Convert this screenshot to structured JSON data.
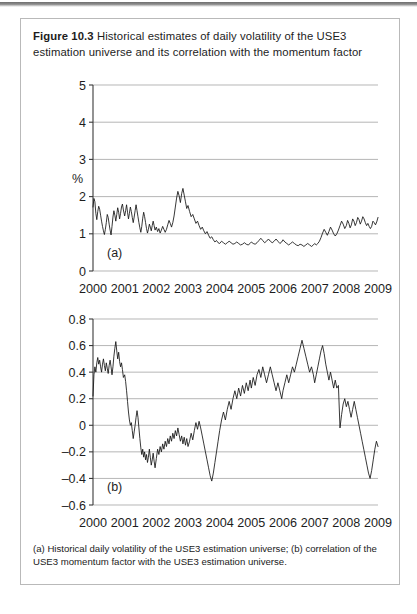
{
  "figure": {
    "label": "Figure 10.3",
    "title_text": "Historical estimates of daily volatility of the USE3 estimation universe and its correlation with the momentum factor",
    "caption": "(a) Historical daily volatility of the USE3 estimation universe; (b) correlation of the USE3 momentum factor with the USE3 estimation universe.",
    "border_color": "#b9b9b9"
  },
  "chart_data": [
    {
      "id": "a",
      "type": "line",
      "panel_label": "(a)",
      "title": "Historical daily volatility of the USE3 estimation universe",
      "xlabel": "",
      "ylabel": "%",
      "xlim": [
        2000,
        2009
      ],
      "ylim": [
        0,
        5
      ],
      "yticks": [
        0,
        1,
        2,
        3,
        4,
        5
      ],
      "ytick_labels": [
        "0",
        "1",
        "2",
        "3",
        "4",
        "5"
      ],
      "xticks": [
        2000,
        2001,
        2002,
        2003,
        2004,
        2005,
        2006,
        2007,
        2008,
        2009
      ],
      "xtick_labels": [
        "2000",
        "2001",
        "2002",
        "2003",
        "2004",
        "2005",
        "2006",
        "2007",
        "2008",
        "2009"
      ],
      "grid": "horizontal",
      "legend": "none",
      "line_color": "#141414",
      "series": [
        {
          "name": "USE3 daily volatility",
          "x": [
            2000.0,
            2000.03,
            2000.06,
            2000.09,
            2000.12,
            2000.15,
            2000.18,
            2000.21,
            2000.24,
            2000.27,
            2000.3,
            2000.33,
            2000.36,
            2000.39,
            2000.42,
            2000.45,
            2000.48,
            2000.51,
            2000.54,
            2000.57,
            2000.6,
            2000.63,
            2000.66,
            2000.69,
            2000.72,
            2000.75,
            2000.78,
            2000.81,
            2000.84,
            2000.87,
            2000.9,
            2000.93,
            2000.96,
            2001.0,
            2001.03,
            2001.06,
            2001.09,
            2001.12,
            2001.15,
            2001.18,
            2001.21,
            2001.24,
            2001.27,
            2001.3,
            2001.33,
            2001.36,
            2001.39,
            2001.42,
            2001.45,
            2001.48,
            2001.51,
            2001.54,
            2001.57,
            2001.6,
            2001.63,
            2001.66,
            2001.69,
            2001.72,
            2001.75,
            2001.78,
            2001.81,
            2001.84,
            2001.87,
            2001.9,
            2001.93,
            2001.96,
            2002.0,
            2002.04,
            2002.08,
            2002.12,
            2002.16,
            2002.2,
            2002.24,
            2002.28,
            2002.32,
            2002.36,
            2002.4,
            2002.44,
            2002.48,
            2002.52,
            2002.56,
            2002.6,
            2002.64,
            2002.68,
            2002.72,
            2002.76,
            2002.8,
            2002.84,
            2002.88,
            2002.92,
            2002.96,
            2003.0,
            2003.05,
            2003.1,
            2003.15,
            2003.2,
            2003.25,
            2003.3,
            2003.35,
            2003.4,
            2003.45,
            2003.5,
            2003.55,
            2003.6,
            2003.65,
            2003.7,
            2003.75,
            2003.8,
            2003.85,
            2003.9,
            2003.95,
            2004.0,
            2004.06,
            2004.12,
            2004.18,
            2004.24,
            2004.3,
            2004.36,
            2004.42,
            2004.48,
            2004.54,
            2004.6,
            2004.66,
            2004.72,
            2004.78,
            2004.84,
            2004.9,
            2004.96,
            2005.0,
            2005.06,
            2005.12,
            2005.18,
            2005.24,
            2005.3,
            2005.36,
            2005.42,
            2005.48,
            2005.54,
            2005.6,
            2005.66,
            2005.72,
            2005.78,
            2005.84,
            2005.9,
            2005.96,
            2006.0,
            2006.06,
            2006.12,
            2006.18,
            2006.24,
            2006.3,
            2006.36,
            2006.42,
            2006.48,
            2006.54,
            2006.6,
            2006.66,
            2006.72,
            2006.78,
            2006.84,
            2006.9,
            2006.96,
            2007.0,
            2007.05,
            2007.1,
            2007.15,
            2007.2,
            2007.25,
            2007.3,
            2007.35,
            2007.4,
            2007.45,
            2007.5,
            2007.55,
            2007.6,
            2007.65,
            2007.7,
            2007.75,
            2007.8,
            2007.85,
            2007.9,
            2007.95,
            2008.0,
            2008.04,
            2008.08,
            2008.12,
            2008.16,
            2008.2,
            2008.24,
            2008.28,
            2008.32,
            2008.36,
            2008.4,
            2008.44,
            2008.48,
            2008.52,
            2008.56,
            2008.6,
            2008.64,
            2008.68,
            2008.72,
            2008.76,
            2008.8,
            2008.84,
            2008.88,
            2008.92,
            2008.96,
            2009.0
          ],
          "y": [
            1.72,
            1.95,
            1.86,
            1.55,
            1.38,
            1.6,
            1.74,
            1.66,
            1.5,
            1.34,
            1.2,
            1.08,
            0.98,
            1.12,
            1.3,
            1.52,
            1.44,
            1.26,
            1.1,
            0.97,
            1.2,
            1.45,
            1.62,
            1.5,
            1.34,
            1.52,
            1.7,
            1.58,
            1.4,
            1.55,
            1.72,
            1.8,
            1.64,
            1.48,
            1.62,
            1.78,
            1.58,
            1.4,
            1.55,
            1.72,
            1.6,
            1.44,
            1.3,
            1.45,
            1.62,
            1.78,
            1.62,
            1.46,
            1.3,
            1.16,
            1.04,
            1.2,
            1.42,
            1.58,
            1.46,
            1.3,
            1.14,
            1.02,
            1.12,
            1.26,
            1.18,
            1.08,
            1.22,
            1.34,
            1.22,
            1.1,
            1.18,
            1.06,
            1.14,
            1.02,
            1.1,
            1.2,
            1.12,
            1.04,
            1.12,
            1.24,
            1.36,
            1.28,
            1.18,
            1.3,
            1.48,
            1.72,
            1.96,
            2.14,
            2.02,
            1.84,
            2.08,
            2.22,
            2.04,
            1.86,
            1.68,
            1.76,
            1.6,
            1.46,
            1.52,
            1.4,
            1.28,
            1.34,
            1.22,
            1.12,
            1.18,
            1.08,
            1.0,
            1.06,
            0.96,
            0.88,
            0.92,
            0.84,
            0.78,
            0.82,
            0.76,
            0.74,
            0.8,
            0.76,
            0.72,
            0.76,
            0.8,
            0.76,
            0.72,
            0.74,
            0.78,
            0.74,
            0.7,
            0.72,
            0.76,
            0.72,
            0.7,
            0.74,
            0.78,
            0.74,
            0.72,
            0.76,
            0.82,
            0.88,
            0.82,
            0.76,
            0.8,
            0.86,
            0.8,
            0.76,
            0.8,
            0.86,
            0.8,
            0.74,
            0.78,
            0.84,
            0.78,
            0.74,
            0.7,
            0.74,
            0.78,
            0.74,
            0.7,
            0.68,
            0.72,
            0.7,
            0.66,
            0.7,
            0.74,
            0.7,
            0.66,
            0.7,
            0.74,
            0.7,
            0.74,
            0.8,
            0.9,
            1.02,
            1.12,
            1.04,
            0.96,
            1.06,
            1.18,
            1.1,
            1.0,
            0.94,
            1.0,
            1.1,
            1.22,
            1.34,
            1.26,
            1.14,
            1.22,
            1.36,
            1.28,
            1.16,
            1.24,
            1.4,
            1.34,
            1.22,
            1.3,
            1.44,
            1.38,
            1.26,
            1.34,
            1.46,
            1.4,
            1.3,
            1.22,
            1.28,
            1.2,
            1.14,
            1.2,
            1.34,
            1.3,
            1.24,
            1.32,
            1.44,
            1.38,
            1.3,
            1.4,
            1.52,
            1.46,
            1.38,
            1.5,
            1.64,
            1.58,
            1.48,
            1.58,
            1.72,
            1.66,
            1.56,
            1.5,
            1.44,
            1.52,
            1.7,
            2.1,
            2.7,
            3.4,
            4.05,
            4.28,
            4.1,
            4.5,
            4.05,
            3.7,
            3.4,
            3.12,
            3.26,
            3.05,
            2.86,
            3.05,
            2.8,
            2.6,
            2.42,
            2.22,
            2.02,
            1.86,
            1.7,
            1.58,
            1.46
          ]
        }
      ]
    },
    {
      "id": "b",
      "type": "line",
      "panel_label": "(b)",
      "title": "Correlation of the USE3 momentum factor with the USE3 estimation universe",
      "xlabel": "",
      "ylabel": "",
      "xlim": [
        2000,
        2009
      ],
      "ylim": [
        -0.6,
        0.8
      ],
      "yticks": [
        -0.6,
        -0.4,
        -0.2,
        0,
        0.2,
        0.4,
        0.6,
        0.8
      ],
      "ytick_labels": [
        "–0.6",
        "–0.4",
        "–0.2",
        "0",
        "0.2",
        "0.4",
        "0.6",
        "0.8"
      ],
      "xticks": [
        2000,
        2001,
        2002,
        2003,
        2004,
        2005,
        2006,
        2007,
        2008,
        2009
      ],
      "xtick_labels": [
        "2000",
        "2001",
        "2002",
        "2003",
        "2004",
        "2005",
        "2006",
        "2007",
        "2008",
        "2009"
      ],
      "grid": "horizontal",
      "legend": "none",
      "line_color": "#141414",
      "series": [
        {
          "name": "Correlation with momentum factor",
          "x": [
            2000.0,
            2000.03,
            2000.06,
            2000.09,
            2000.12,
            2000.15,
            2000.18,
            2000.21,
            2000.24,
            2000.27,
            2000.3,
            2000.33,
            2000.36,
            2000.39,
            2000.42,
            2000.45,
            2000.48,
            2000.51,
            2000.54,
            2000.57,
            2000.6,
            2000.63,
            2000.66,
            2000.69,
            2000.72,
            2000.75,
            2000.78,
            2000.81,
            2000.84,
            2000.87,
            2000.9,
            2000.93,
            2000.96,
            2001.0,
            2001.03,
            2001.06,
            2001.09,
            2001.12,
            2001.15,
            2001.18,
            2001.21,
            2001.24,
            2001.27,
            2001.3,
            2001.33,
            2001.36,
            2001.39,
            2001.42,
            2001.45,
            2001.48,
            2001.51,
            2001.54,
            2001.57,
            2001.6,
            2001.63,
            2001.66,
            2001.69,
            2001.72,
            2001.75,
            2001.78,
            2001.81,
            2001.84,
            2001.87,
            2001.9,
            2001.93,
            2001.96,
            2002.0,
            2002.04,
            2002.08,
            2002.12,
            2002.16,
            2002.2,
            2002.24,
            2002.28,
            2002.32,
            2002.36,
            2002.4,
            2002.44,
            2002.48,
            2002.52,
            2002.56,
            2002.6,
            2002.64,
            2002.68,
            2002.72,
            2002.76,
            2002.8,
            2002.84,
            2002.88,
            2002.92,
            2002.96,
            2003.0,
            2003.05,
            2003.1,
            2003.15,
            2003.2,
            2003.25,
            2003.3,
            2003.35,
            2003.4,
            2003.45,
            2003.5,
            2003.55,
            2003.6,
            2003.65,
            2003.7,
            2003.75,
            2003.8,
            2003.85,
            2003.9,
            2003.95,
            2004.0,
            2004.06,
            2004.12,
            2004.18,
            2004.24,
            2004.3,
            2004.36,
            2004.42,
            2004.48,
            2004.54,
            2004.6,
            2004.66,
            2004.72,
            2004.78,
            2004.84,
            2004.9,
            2004.96,
            2005.0,
            2005.06,
            2005.12,
            2005.18,
            2005.24,
            2005.3,
            2005.36,
            2005.42,
            2005.48,
            2005.54,
            2005.6,
            2005.66,
            2005.72,
            2005.78,
            2005.84,
            2005.9,
            2005.96,
            2006.0,
            2006.06,
            2006.12,
            2006.18,
            2006.24,
            2006.3,
            2006.36,
            2006.42,
            2006.48,
            2006.54,
            2006.6,
            2006.66,
            2006.72,
            2006.78,
            2006.84,
            2006.9,
            2006.96,
            2007.0,
            2007.05,
            2007.1,
            2007.15,
            2007.2,
            2007.25,
            2007.3,
            2007.35,
            2007.4,
            2007.45,
            2007.5,
            2007.55,
            2007.6,
            2007.65,
            2007.7,
            2007.75,
            2007.8,
            2007.85,
            2007.9,
            2007.95,
            2008.0,
            2008.05,
            2008.1,
            2008.15,
            2008.2,
            2008.25,
            2008.3,
            2008.35,
            2008.4,
            2008.45,
            2008.5,
            2008.55,
            2008.6,
            2008.65,
            2008.7,
            2008.75,
            2008.8,
            2008.85,
            2008.9,
            2008.95,
            2009.0
          ],
          "y": [
            0.22,
            0.38,
            0.44,
            0.4,
            0.47,
            0.51,
            0.46,
            0.49,
            0.44,
            0.4,
            0.46,
            0.5,
            0.45,
            0.41,
            0.47,
            0.43,
            0.39,
            0.45,
            0.49,
            0.44,
            0.38,
            0.44,
            0.52,
            0.58,
            0.63,
            0.56,
            0.5,
            0.55,
            0.48,
            0.44,
            0.47,
            0.42,
            0.36,
            0.38,
            0.33,
            0.26,
            0.18,
            0.1,
            0.04,
            0.0,
            0.02,
            -0.04,
            -0.1,
            -0.05,
            0.0,
            0.06,
            0.11,
            0.06,
            -0.02,
            -0.1,
            -0.17,
            -0.22,
            -0.18,
            -0.24,
            -0.2,
            -0.26,
            -0.22,
            -0.28,
            -0.24,
            -0.18,
            -0.24,
            -0.3,
            -0.26,
            -0.21,
            -0.27,
            -0.32,
            -0.25,
            -0.18,
            -0.22,
            -0.16,
            -0.2,
            -0.14,
            -0.18,
            -0.12,
            -0.16,
            -0.1,
            -0.14,
            -0.08,
            -0.12,
            -0.06,
            -0.1,
            -0.04,
            -0.08,
            -0.02,
            -0.07,
            -0.12,
            -0.08,
            -0.14,
            -0.09,
            -0.15,
            -0.1,
            -0.16,
            -0.12,
            -0.06,
            -0.11,
            -0.04,
            0.02,
            -0.03,
            0.03,
            -0.02,
            -0.08,
            -0.14,
            -0.2,
            -0.26,
            -0.32,
            -0.38,
            -0.42,
            -0.36,
            -0.28,
            -0.2,
            -0.12,
            -0.04,
            0.04,
            0.1,
            0.04,
            0.12,
            0.18,
            0.12,
            0.2,
            0.26,
            0.2,
            0.28,
            0.22,
            0.3,
            0.24,
            0.32,
            0.26,
            0.34,
            0.28,
            0.36,
            0.3,
            0.38,
            0.42,
            0.36,
            0.44,
            0.38,
            0.32,
            0.38,
            0.44,
            0.38,
            0.32,
            0.26,
            0.32,
            0.26,
            0.2,
            0.26,
            0.32,
            0.38,
            0.32,
            0.38,
            0.44,
            0.4,
            0.46,
            0.52,
            0.58,
            0.64,
            0.58,
            0.52,
            0.46,
            0.4,
            0.44,
            0.38,
            0.32,
            0.38,
            0.44,
            0.5,
            0.56,
            0.6,
            0.54,
            0.46,
            0.4,
            0.34,
            0.4,
            0.34,
            0.28,
            0.34,
            0.28,
            0.3,
            -0.02,
            0.08,
            0.16,
            0.2,
            0.14,
            0.18,
            0.12,
            0.06,
            0.12,
            0.18,
            0.12,
            0.06,
            0.0,
            -0.06,
            -0.12,
            -0.18,
            -0.24,
            -0.3,
            -0.36,
            -0.4,
            -0.34,
            -0.26,
            -0.18,
            -0.12,
            -0.16,
            -0.1,
            -0.16,
            -0.22,
            -0.28,
            -0.34,
            -0.4,
            -0.46,
            -0.5,
            -0.44,
            -0.38,
            -0.42,
            -0.36,
            -0.34
          ]
        }
      ]
    }
  ]
}
